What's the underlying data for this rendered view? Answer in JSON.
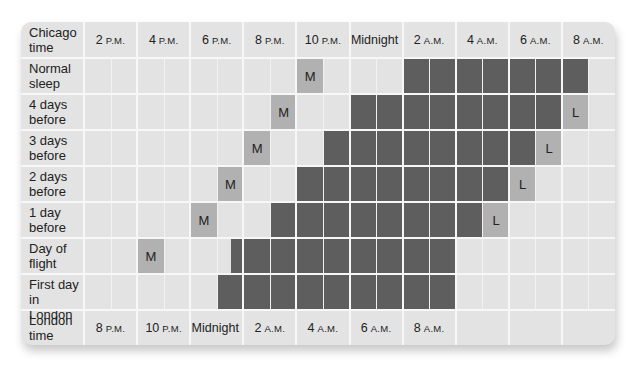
{
  "colors": {
    "card_bg": "#e3e3e3",
    "grid_line": "#f7f7f7",
    "sleep_block": "#5e5e5e",
    "marker": "#b1b1b1"
  },
  "chart_data": {
    "type": "table",
    "title": "",
    "cell_unit": "30 minutes",
    "start_time_chicago": "2 P.M.",
    "header_row": {
      "label": "Chicago time",
      "ticks": [
        {
          "num": "2",
          "suf": "P.M."
        },
        {
          "num": "4",
          "suf": "P.M."
        },
        {
          "num": "6",
          "suf": "P.M."
        },
        {
          "num": "8",
          "suf": "P.M."
        },
        {
          "num": "10",
          "suf": "P.M."
        },
        {
          "num": "Midnight",
          "suf": ""
        },
        {
          "num": "2",
          "suf": "A.M."
        },
        {
          "num": "4",
          "suf": "A.M."
        },
        {
          "num": "6",
          "suf": "A.M."
        },
        {
          "num": "8",
          "suf": "A.M."
        }
      ]
    },
    "footer_row": {
      "label": "London time",
      "ticks": [
        {
          "num": "8",
          "suf": "P.M."
        },
        {
          "num": "10",
          "suf": "P.M."
        },
        {
          "num": "Midnight",
          "suf": ""
        },
        {
          "num": "2",
          "suf": "A.M."
        },
        {
          "num": "4",
          "suf": "A.M."
        },
        {
          "num": "6",
          "suf": "A.M."
        },
        {
          "num": "8",
          "suf": "A.M."
        },
        {
          "num": "",
          "suf": ""
        },
        {
          "num": "",
          "suf": ""
        },
        {
          "num": "",
          "suf": ""
        }
      ]
    },
    "legend": {
      "M": "Melatonin",
      "L": "Light exposure",
      "dark_block": "Sleep"
    },
    "rows": [
      {
        "label": "Normal sleep",
        "sleep_start": 12,
        "sleep_end": 19,
        "m_at": 8,
        "l_at": null
      },
      {
        "label": "4 days before",
        "sleep_start": 10,
        "sleep_end": 18,
        "m_at": 7,
        "l_at": 18
      },
      {
        "label": "3 days before",
        "sleep_start": 9,
        "sleep_end": 17,
        "m_at": 6,
        "l_at": 17
      },
      {
        "label": "2 days before",
        "sleep_start": 8,
        "sleep_end": 16,
        "m_at": 5,
        "l_at": 16
      },
      {
        "label": "1 day before",
        "sleep_start": 7,
        "sleep_end": 15,
        "m_at": 4,
        "l_at": 15
      },
      {
        "label": "Day of flight",
        "sleep_start": 5.5,
        "sleep_end": 14,
        "m_at": 2,
        "l_at": null
      },
      {
        "label": "First day in London",
        "sleep_start": 5,
        "sleep_end": 14,
        "m_at": null,
        "l_at": null
      }
    ],
    "marker_text": {
      "m": "M",
      "l": "L"
    }
  }
}
